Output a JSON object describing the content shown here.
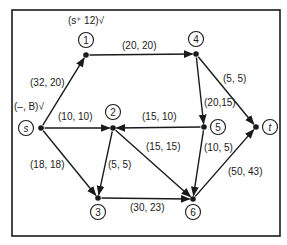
{
  "diagram": {
    "type": "flow-network",
    "nodes": [
      {
        "id": "s",
        "label": "s",
        "dot": [
          41,
          128
        ],
        "circle": [
          26,
          128
        ],
        "italic": true
      },
      {
        "id": "1",
        "label": "1",
        "dot": [
          86,
          55
        ],
        "circle": [
          86,
          40
        ]
      },
      {
        "id": "2",
        "label": "2",
        "dot": [
          113,
          128
        ],
        "circle": [
          113,
          112
        ]
      },
      {
        "id": "3",
        "label": "3",
        "dot": [
          98,
          198
        ],
        "circle": [
          98,
          212
        ]
      },
      {
        "id": "4",
        "label": "4",
        "dot": [
          196,
          54
        ],
        "circle": [
          196,
          39
        ]
      },
      {
        "id": "5",
        "label": "5",
        "dot": [
          204,
          127
        ],
        "circle": [
          218,
          127
        ]
      },
      {
        "id": "6",
        "label": "6",
        "dot": [
          193,
          199
        ],
        "circle": [
          193,
          212
        ]
      },
      {
        "id": "t",
        "label": "t",
        "dot": [
          256,
          127
        ],
        "circle": [
          270,
          127
        ],
        "italic": true
      }
    ],
    "edges": [
      {
        "from": "s",
        "to": "1",
        "label": "(32, 20)",
        "lx": 30,
        "ly": 86
      },
      {
        "from": "s",
        "to": "2",
        "label": "(10, 10)",
        "lx": 58,
        "ly": 120
      },
      {
        "from": "s",
        "to": "3",
        "label": "(18, 18)",
        "lx": 30,
        "ly": 168
      },
      {
        "from": "1",
        "to": "4",
        "label": "(20, 20)",
        "lx": 122,
        "ly": 49
      },
      {
        "from": "5",
        "to": "2",
        "label": "(15, 10)",
        "lx": 142,
        "ly": 120
      },
      {
        "from": "2",
        "to": "3",
        "label": "(5, 5)",
        "lx": 108,
        "ly": 168
      },
      {
        "from": "2",
        "to": "6",
        "label": "(15, 15)",
        "lx": 146,
        "ly": 150
      },
      {
        "from": "3",
        "to": "6",
        "label": "(30, 23)",
        "lx": 130,
        "ly": 211
      },
      {
        "from": "4",
        "to": "5",
        "label": "(20,15)",
        "lx": 204,
        "ly": 106
      },
      {
        "from": "4",
        "to": "t",
        "label": "(5, 5)",
        "lx": 223,
        "ly": 82
      },
      {
        "from": "5",
        "to": "6",
        "label": "(10, 5)",
        "lx": 204,
        "ly": 151
      },
      {
        "from": "6",
        "to": "t",
        "label": "(50, 43)",
        "lx": 228,
        "ly": 175
      }
    ],
    "annotations": [
      {
        "id": "source-label",
        "text": "(–, B)√",
        "x": 14,
        "y": 110
      },
      {
        "id": "node1-label",
        "text": "(s⁺  12)√",
        "x": 68,
        "y": 24
      }
    ],
    "frame": {
      "x": 12,
      "y": 10,
      "w": 268,
      "h": 226
    }
  }
}
